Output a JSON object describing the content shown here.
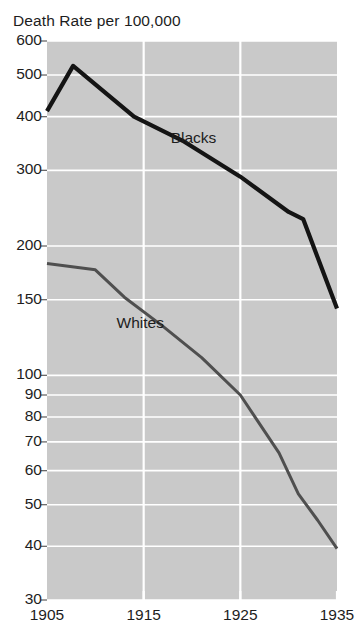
{
  "chart_data": {
    "type": "line",
    "title": "Death Rate per 100,000",
    "xlabel": "",
    "ylabel": "",
    "yscale": "log",
    "ylim": [
      30,
      600
    ],
    "xlim": [
      1905,
      1935
    ],
    "grid": true,
    "legend_position": "inline-annotation",
    "plot_background": "#c9c9c9",
    "gridline_color": "#ffffff",
    "xticks": [
      "1905",
      "1915",
      "1925",
      "1935"
    ],
    "xtick_values": [
      1905,
      1915,
      1925,
      1935
    ],
    "yticks": [
      "600",
      "500",
      "400",
      "300",
      "200",
      "150",
      "100",
      "90",
      "80",
      "70",
      "60",
      "50",
      "40",
      "30"
    ],
    "ytick_values": [
      600,
      500,
      400,
      300,
      200,
      150,
      100,
      90,
      80,
      70,
      60,
      50,
      40,
      30
    ],
    "ygridline_values": [
      600,
      500,
      400,
      300,
      200,
      150,
      100,
      90,
      80,
      70,
      60,
      50,
      40,
      30
    ],
    "series": [
      {
        "name": "Blacks",
        "color": "#141414",
        "linewidth": 4.2,
        "label_x": 1917.8,
        "label_y": 355,
        "x": [
          1905,
          1907.7,
          1914.0,
          1919.0,
          1925.0,
          1930.0,
          1931.5,
          1935.0
        ],
        "values": [
          412,
          525,
          400,
          352,
          290,
          240,
          231,
          143
        ]
      },
      {
        "name": "Whites",
        "color": "#4f4f4f",
        "linewidth": 3.0,
        "label_x": 1912.2,
        "label_y": 132,
        "x": [
          1905,
          1910.0,
          1913.0,
          1917.0,
          1921.0,
          1925.0,
          1929.0,
          1931.0,
          1933.0,
          1935.0
        ],
        "values": [
          182,
          176,
          152,
          130,
          110,
          90,
          66,
          53,
          46,
          39.5
        ]
      }
    ]
  }
}
